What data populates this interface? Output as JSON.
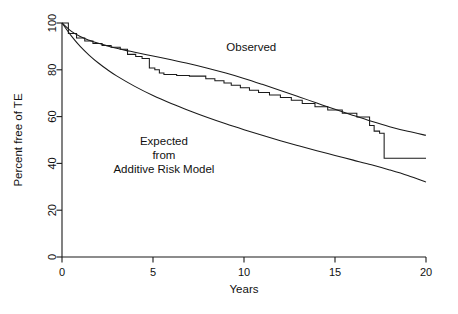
{
  "chart_data": {
    "type": "line",
    "title": "",
    "xlabel": "Years",
    "ylabel": "Percent free of TE",
    "xlim": [
      0,
      20
    ],
    "ylim": [
      0,
      100
    ],
    "grid": false,
    "legend_position": "inline-annotation",
    "xticks": [
      "0",
      "5",
      "10",
      "15",
      "20"
    ],
    "xtick_values": [
      0,
      5,
      10,
      15,
      20
    ],
    "yticks": [
      "0",
      "20",
      "40",
      "60",
      "80",
      "100"
    ],
    "ytick_values": [
      0,
      20,
      40,
      60,
      80,
      100
    ],
    "annotations": [
      {
        "id": "observed",
        "text": "Observed",
        "x": 10.4,
        "y": 88
      },
      {
        "id": "expected_line1",
        "text": "Expected",
        "x": 5.6,
        "y": 48
      },
      {
        "id": "expected_line2",
        "text": "from",
        "x": 5.6,
        "y": 42
      },
      {
        "id": "expected_line3",
        "text": "Additive Risk Model",
        "x": 5.6,
        "y": 36
      }
    ],
    "series": [
      {
        "name": "Observed",
        "style": "smooth",
        "color": "#1a1a1a",
        "x": [
          0,
          0.5,
          1,
          1.5,
          2,
          2.5,
          3,
          3.5,
          4,
          5,
          6,
          7,
          8,
          9,
          10,
          11,
          12,
          13,
          14,
          15,
          16,
          17,
          18,
          19,
          20
        ],
        "values": [
          100,
          96.5,
          94.2,
          92.6,
          91.3,
          90.2,
          89.2,
          88.3,
          87.5,
          85.9,
          84.3,
          82.6,
          80.7,
          78.6,
          76.3,
          73.8,
          71.2,
          68.5,
          65.8,
          63.1,
          60.5,
          58.0,
          55.7,
          53.7,
          52.0
        ]
      },
      {
        "name": "Observed (Kaplan-Meier step)",
        "style": "step",
        "color": "#1a1a1a",
        "x": [
          0,
          0.35,
          0.35,
          0.8,
          0.8,
          1.25,
          1.25,
          1.7,
          1.7,
          2.2,
          2.2,
          2.7,
          2.7,
          3.2,
          3.2,
          3.6,
          3.6,
          4.05,
          4.05,
          4.4,
          4.4,
          4.8,
          4.8,
          5.1,
          5.1,
          5.35,
          5.35,
          5.6,
          5.6,
          6.3,
          6.3,
          7.0,
          7.0,
          7.9,
          7.9,
          8.4,
          8.4,
          8.9,
          8.9,
          9.3,
          9.3,
          9.8,
          9.8,
          10.3,
          10.3,
          10.8,
          10.8,
          11.4,
          11.4,
          12.0,
          12.0,
          12.6,
          12.6,
          13.2,
          13.2,
          13.9,
          13.9,
          14.6,
          14.6,
          15.4,
          15.4,
          16.2,
          16.2,
          16.9,
          16.9,
          17.15,
          17.15,
          17.45,
          17.45,
          17.7,
          17.7,
          20
        ],
        "values": [
          100,
          100,
          95.5,
          95.5,
          93.6,
          93.6,
          92.3,
          92.3,
          91.2,
          91.2,
          90.4,
          90.4,
          89.6,
          89.6,
          88.8,
          88.8,
          86.6,
          86.6,
          85.7,
          85.7,
          84.8,
          84.8,
          80.8,
          80.8,
          80.0,
          80.0,
          78.6,
          78.6,
          78.0,
          78.0,
          77.6,
          77.6,
          77.3,
          77.3,
          76.2,
          76.2,
          75.3,
          75.3,
          74.4,
          74.4,
          73.4,
          73.4,
          72.3,
          72.3,
          71.3,
          71.3,
          70.3,
          70.3,
          69.2,
          69.2,
          68.2,
          68.2,
          67.0,
          67.0,
          65.6,
          65.6,
          64.2,
          64.2,
          62.8,
          62.8,
          61.4,
          61.4,
          59.8,
          59.8,
          56.2,
          56.2,
          53.8,
          53.8,
          52.9,
          52.9,
          42.2,
          42.2
        ]
      },
      {
        "name": "Expected from Additive Risk Model",
        "style": "smooth",
        "color": "#1a1a1a",
        "x": [
          0,
          0.5,
          1,
          1.5,
          2,
          2.5,
          3,
          4,
          5,
          6,
          7,
          8,
          9,
          10,
          11,
          12,
          13,
          14,
          15,
          16,
          17,
          18,
          19,
          20
        ],
        "values": [
          100,
          94.6,
          90.0,
          86.2,
          82.9,
          80.0,
          77.4,
          72.9,
          69.0,
          65.6,
          62.5,
          59.6,
          56.9,
          54.4,
          52.0,
          49.7,
          47.5,
          45.4,
          43.4,
          41.4,
          39.4,
          37.2,
          34.8,
          32.0
        ]
      }
    ]
  }
}
